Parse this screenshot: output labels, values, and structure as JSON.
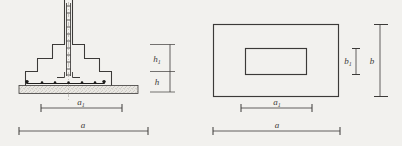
{
  "drawing": {
    "title": "reinforced-concrete-stepped-footing",
    "background_color": "#f2f1ee",
    "line_color": "#3c3a38",
    "views": [
      {
        "name": "section-view",
        "description": "stepped footing section with column rebar cage and blinding layer",
        "dimensions": [
          {
            "id": "h1",
            "label": "h",
            "subscript": "1",
            "orientation": "vertical"
          },
          {
            "id": "h",
            "label": "h",
            "subscript": "",
            "orientation": "vertical"
          },
          {
            "id": "a1",
            "label": "a",
            "subscript": "1",
            "orientation": "horizontal"
          },
          {
            "id": "a",
            "label": "a",
            "subscript": "",
            "orientation": "horizontal"
          }
        ]
      },
      {
        "name": "plan-view",
        "description": "rectangular footing plan with concentric inner column rectangle",
        "dimensions": [
          {
            "id": "b1",
            "label": "b",
            "subscript": "1",
            "orientation": "vertical"
          },
          {
            "id": "b",
            "label": "b",
            "subscript": "",
            "orientation": "vertical"
          },
          {
            "id": "a1",
            "label": "a",
            "subscript": "1",
            "orientation": "horizontal"
          },
          {
            "id": "a",
            "label": "a",
            "subscript": "",
            "orientation": "horizontal"
          }
        ]
      }
    ]
  },
  "labels": {
    "h1_main": "h",
    "h1_sub": "1",
    "h_main": "h",
    "h_sub": "",
    "b1_main": "b",
    "b1_sub": "1",
    "b_main": "b",
    "b_sub": "",
    "left_a1_main": "a",
    "left_a1_sub": "1",
    "left_a_main": "a",
    "left_a_sub": "",
    "right_a1_main": "a",
    "right_a1_sub": "1",
    "right_a_main": "a",
    "right_a_sub": ""
  }
}
